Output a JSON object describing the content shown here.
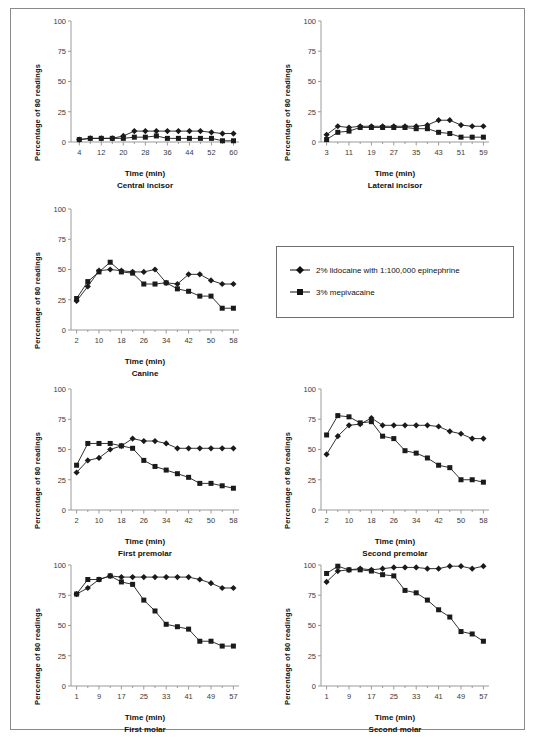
{
  "figure": {
    "y_axis_label": "Percentage of 80 readings",
    "x_axis_label": "Time (min)",
    "y_ticks": [
      0,
      25,
      50,
      75,
      100
    ],
    "ylim": [
      0,
      100
    ]
  },
  "legend": {
    "position": "middle-right",
    "entries": [
      {
        "label": "2% lidocaine with 1:100,000 epinephrine",
        "marker": "diamond",
        "color": "#111111"
      },
      {
        "label": "3% mepivacaine",
        "marker": "square",
        "color": "#111111"
      }
    ]
  },
  "chart_data": [
    {
      "id": "central-incisor",
      "type": "line",
      "title": "Central incisor",
      "xlabel": "Time (min)",
      "ylabel": "Percentage of 80 readings",
      "ylim": [
        0,
        100
      ],
      "xlim": [
        1,
        62
      ],
      "grid": false,
      "xticks": [
        4,
        12,
        20,
        28,
        36,
        44,
        52,
        60
      ],
      "x": [
        4,
        8,
        12,
        16,
        20,
        24,
        28,
        32,
        36,
        40,
        44,
        48,
        52,
        56,
        60
      ],
      "series": [
        {
          "name": "2% lidocaine with 1:100,000 epinephrine",
          "marker": "diamond",
          "values": [
            2,
            3,
            3,
            3,
            5,
            9,
            9,
            9,
            9,
            9,
            9,
            9,
            8,
            7,
            7
          ]
        },
        {
          "name": "3% mepivacaine",
          "marker": "square",
          "values": [
            2,
            3,
            3,
            3,
            3,
            4,
            4,
            5,
            3,
            3,
            3,
            3,
            3,
            1,
            1
          ]
        }
      ]
    },
    {
      "id": "lateral-incisor",
      "type": "line",
      "title": "Lateral incisor",
      "xlabel": "Time (min)",
      "ylabel": "Percentage of 80 readings",
      "ylim": [
        0,
        100
      ],
      "xlim": [
        1,
        61
      ],
      "grid": false,
      "xticks": [
        3,
        11,
        19,
        27,
        35,
        43,
        51,
        59
      ],
      "x": [
        3,
        7,
        11,
        15,
        19,
        23,
        27,
        31,
        35,
        39,
        43,
        47,
        51,
        55,
        59
      ],
      "series": [
        {
          "name": "2% lidocaine with 1:100,000 epinephrine",
          "marker": "diamond",
          "values": [
            6,
            13,
            12,
            13,
            13,
            13,
            13,
            13,
            13,
            14,
            18,
            18,
            14,
            13,
            13
          ]
        },
        {
          "name": "3% mepivacaine",
          "marker": "square",
          "values": [
            2,
            8,
            9,
            12,
            12,
            12,
            12,
            12,
            11,
            11,
            8,
            7,
            4,
            4,
            4
          ]
        }
      ]
    },
    {
      "id": "canine",
      "type": "line",
      "title": "Canine",
      "xlabel": "Time (min)",
      "ylabel": "Percentage of 80 readings",
      "ylim": [
        0,
        100
      ],
      "xlim": [
        0,
        60
      ],
      "grid": false,
      "xticks": [
        2,
        10,
        18,
        26,
        34,
        42,
        50,
        58
      ],
      "x": [
        2,
        6,
        10,
        14,
        18,
        22,
        26,
        30,
        34,
        38,
        42,
        46,
        50,
        54,
        58
      ],
      "series": [
        {
          "name": "2% lidocaine with 1:100,000 epinephrine",
          "marker": "diamond",
          "values": [
            24,
            36,
            49,
            50,
            49,
            48,
            48,
            50,
            39,
            38,
            46,
            46,
            41,
            38,
            38
          ]
        },
        {
          "name": "3% mepivacaine",
          "marker": "square",
          "values": [
            26,
            40,
            48,
            56,
            48,
            47,
            38,
            38,
            39,
            34,
            32,
            28,
            28,
            18,
            18
          ]
        }
      ]
    },
    {
      "id": "first-premolar",
      "type": "line",
      "title": "First premolar",
      "xlabel": "Time (min)",
      "ylabel": "Percentage of 80 readings",
      "ylim": [
        0,
        100
      ],
      "xlim": [
        0,
        60
      ],
      "grid": false,
      "xticks": [
        2,
        10,
        18,
        26,
        34,
        42,
        50,
        58
      ],
      "x": [
        2,
        6,
        10,
        14,
        18,
        22,
        26,
        30,
        34,
        38,
        42,
        46,
        50,
        54,
        58
      ],
      "series": [
        {
          "name": "2% lidocaine with 1:100,000 epinephrine",
          "marker": "diamond",
          "values": [
            31,
            41,
            43,
            50,
            53,
            59,
            57,
            57,
            55,
            51,
            51,
            51,
            51,
            51,
            51
          ]
        },
        {
          "name": "3% mepivacaine",
          "marker": "square",
          "values": [
            37,
            55,
            55,
            55,
            53,
            51,
            41,
            36,
            33,
            30,
            27,
            22,
            22,
            20,
            18
          ]
        }
      ]
    },
    {
      "id": "second-premolar",
      "type": "line",
      "title": "Second premolar",
      "xlabel": "Time (min)",
      "ylabel": "Percentage of 80 readings",
      "ylim": [
        0,
        100
      ],
      "xlim": [
        0,
        60
      ],
      "grid": false,
      "xticks": [
        2,
        10,
        18,
        26,
        34,
        42,
        50,
        58
      ],
      "x": [
        2,
        6,
        10,
        14,
        18,
        22,
        26,
        30,
        34,
        38,
        42,
        46,
        50,
        54,
        58
      ],
      "series": [
        {
          "name": "2% lidocaine with 1:100,000 epinephrine",
          "marker": "diamond",
          "values": [
            46,
            61,
            70,
            71,
            76,
            70,
            70,
            70,
            70,
            70,
            69,
            65,
            63,
            59,
            59
          ]
        },
        {
          "name": "3% mepivacaine",
          "marker": "square",
          "values": [
            62,
            78,
            77,
            72,
            73,
            61,
            59,
            49,
            47,
            43,
            37,
            35,
            25,
            25,
            23
          ]
        }
      ]
    },
    {
      "id": "first-molar",
      "type": "line",
      "title": "First molar",
      "xlabel": "Time (min)",
      "ylabel": "Percentage of 80 readings",
      "ylim": [
        0,
        100
      ],
      "xlim": [
        -1,
        59
      ],
      "grid": false,
      "xticks": [
        1,
        9,
        17,
        25,
        33,
        41,
        49,
        57
      ],
      "x": [
        1,
        5,
        9,
        13,
        17,
        21,
        25,
        29,
        33,
        37,
        41,
        45,
        49,
        53,
        57
      ],
      "series": [
        {
          "name": "2% lidocaine with 1:100,000 epinephrine",
          "marker": "diamond",
          "values": [
            76,
            81,
            88,
            91,
            90,
            90,
            90,
            90,
            90,
            90,
            90,
            88,
            85,
            81,
            81
          ]
        },
        {
          "name": "3% mepivacaine",
          "marker": "square",
          "values": [
            76,
            88,
            88,
            91,
            86,
            84,
            71,
            62,
            51,
            49,
            47,
            37,
            37,
            33,
            33
          ]
        }
      ]
    },
    {
      "id": "second-molar",
      "type": "line",
      "title": "Second molar",
      "xlabel": "Time (min)",
      "ylabel": "Percentage of 80 readings",
      "ylim": [
        0,
        100
      ],
      "xlim": [
        -1,
        59
      ],
      "grid": false,
      "xticks": [
        1,
        9,
        17,
        25,
        33,
        41,
        49,
        57
      ],
      "x": [
        1,
        5,
        9,
        13,
        17,
        21,
        25,
        29,
        33,
        37,
        41,
        45,
        49,
        53,
        57
      ],
      "series": [
        {
          "name": "2% lidocaine with 1:100,000 epinephrine",
          "marker": "diamond",
          "values": [
            86,
            95,
            96,
            97,
            96,
            97,
            98,
            98,
            98,
            97,
            97,
            99,
            99,
            97,
            99
          ]
        },
        {
          "name": "3% mepivacaine",
          "marker": "square",
          "values": [
            93,
            99,
            96,
            96,
            95,
            92,
            91,
            79,
            77,
            71,
            63,
            57,
            45,
            43,
            37
          ]
        }
      ]
    }
  ]
}
